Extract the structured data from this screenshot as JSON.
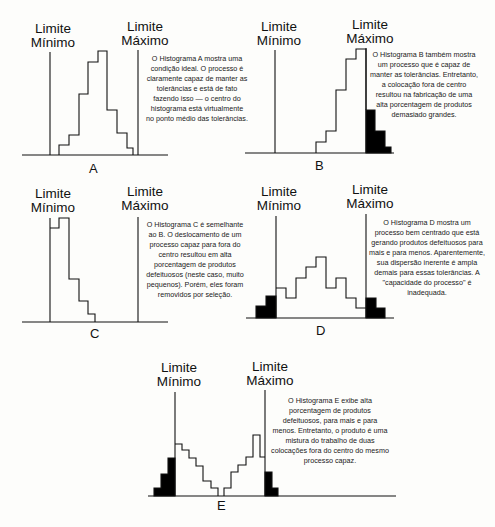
{
  "figure": {
    "lower_limit_label_line1": "Limite",
    "lower_limit_label_line2": "Mínimo",
    "upper_limit_label_line1": "Limite",
    "upper_limit_label_line2": "Máximo",
    "colors": {
      "ink": "#111111",
      "defective_fill": "#000000",
      "background": "#fdfdfb"
    }
  },
  "panels": [
    {
      "id": "A",
      "letter": "A",
      "description": "O Histograma A mostra uma condição ideal. O processo é claramente capaz de manter as tolerâncias e está de fato fazendo isso — o centro do histograma está virtualmente no ponto médio das tolerâncias."
    },
    {
      "id": "B",
      "letter": "B",
      "description": "O Histograma B também mostra um processo que é capaz de manter as tolerâncias. Entretanto, a colocação fora de centro resultou na fabricação de uma alta porcentagem de produtos demasiado grandes."
    },
    {
      "id": "C",
      "letter": "C",
      "description": "O Histograma C é semelhante ao B. O deslocamento de um processo capaz para fora do centro resultou em alta porcentagem de produtos defeituosos (neste caso, muito pequenos). Porém, eles foram removidos por seleção."
    },
    {
      "id": "D",
      "letter": "D",
      "description": "O Histograma D mostra um processo bem centrado que está gerando produtos defeituosos para mais e para menos. Aparentemente, sua dispersão inerente é ampla demais para essas tolerâncias. A \"capacidade do processo\" é inadequada."
    },
    {
      "id": "E",
      "letter": "E",
      "description": "O Histograma E exibe alta porcentagem de produtos defeituosos, para mais e para menos. Entretanto, o produto é uma mistura do trabalho de duas colocações fora do centro do mesmo processo capaz."
    }
  ]
}
